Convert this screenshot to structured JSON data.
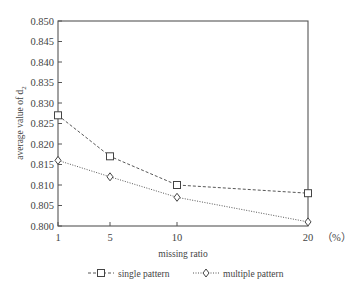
{
  "chart_data": {
    "type": "line",
    "title": "",
    "xlabel": "missing ratio",
    "ylabel": "average value of d",
    "ylabel_subscript": "2",
    "x": [
      1,
      5,
      10,
      20
    ],
    "x_tick_labels": [
      "1",
      "5",
      "10",
      "20"
    ],
    "x_unit_label": "（%）",
    "ylim": [
      0.8,
      0.85
    ],
    "y_ticks": [
      "0.850",
      "0.845",
      "0.840",
      "0.835",
      "0.830",
      "0.825",
      "0.820",
      "0.815",
      "0.810",
      "0.805",
      "0.800"
    ],
    "grid": false,
    "legend_position": "bottom",
    "series": [
      {
        "name": "single pattern",
        "marker": "square",
        "line_style": "dashed",
        "values": [
          0.827,
          0.817,
          0.81,
          0.808
        ]
      },
      {
        "name": "multiple pattern",
        "marker": "diamond",
        "line_style": "dotted",
        "values": [
          0.816,
          0.812,
          0.807,
          0.801
        ]
      }
    ]
  },
  "legend": {
    "items": [
      {
        "label": "single pattern"
      },
      {
        "label": "multiple pattern"
      }
    ]
  },
  "colors": {
    "line": "#444444",
    "axis": "#555555"
  }
}
